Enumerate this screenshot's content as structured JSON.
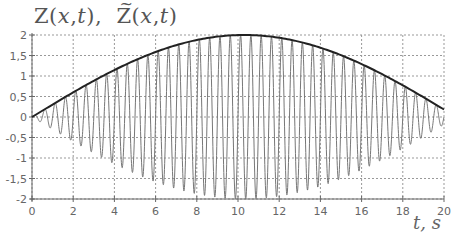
{
  "chart_data": {
    "type": "line",
    "xlabel": "t, s",
    "ylabel": "",
    "xlim": [
      0,
      20
    ],
    "ylim": [
      -2,
      2
    ],
    "x_ticks": [
      0,
      2,
      4,
      6,
      8,
      10,
      12,
      14,
      16,
      18,
      20
    ],
    "y_ticks": [
      2,
      1.5,
      1,
      0.5,
      0,
      -0.5,
      -1,
      -1.5,
      -2
    ],
    "y_tick_labels": [
      "2",
      "1,5",
      "1",
      "0,5",
      "0",
      "-0,5",
      "-1",
      "-1,5",
      "-2"
    ],
    "grid": true,
    "grid_style": "dotted",
    "legend": null,
    "series": [
      {
        "name": "Z(x,t) (envelope)",
        "style": "thick dark line",
        "x": [
          0,
          1,
          2,
          3,
          4,
          5,
          6,
          7,
          8,
          9,
          10,
          11,
          12,
          13,
          14,
          15,
          16,
          17,
          18,
          19,
          20
        ],
        "values": [
          0.0,
          0.3,
          0.6,
          0.88,
          1.14,
          1.37,
          1.57,
          1.73,
          1.86,
          1.95,
          1.99,
          2.0,
          1.96,
          1.88,
          1.77,
          1.61,
          1.43,
          1.21,
          0.97,
          0.72,
          0.3
        ]
      },
      {
        "name": "Z̃(x,t) (oscillating signal)",
        "style": "thin gray line",
        "description": "envelope(t) * sin(2*pi*f*t), carrier frequency ~2 Hz (about 40 cycles over 0–20 s), oscillating between +envelope and -envelope",
        "carrier_frequency_hz": 2,
        "envelope_formula": "2*sin(pi*t/20.6)"
      }
    ]
  }
}
